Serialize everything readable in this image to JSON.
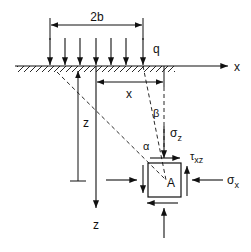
{
  "labels": {
    "width": "2b",
    "load": "q",
    "x_axis": "x",
    "x_dim": "x",
    "z_dim": "z",
    "z_axis": "z",
    "beta": "β",
    "alpha": "α",
    "sigma_z": "σ",
    "sigma_z_sub": "z",
    "tau_xz": "τ",
    "tau_xz_sub": "xz",
    "sigma_x": "σ",
    "sigma_x_sub": "x",
    "point": "A"
  },
  "colors": {
    "line": "#111111",
    "background": "#ffffff"
  }
}
